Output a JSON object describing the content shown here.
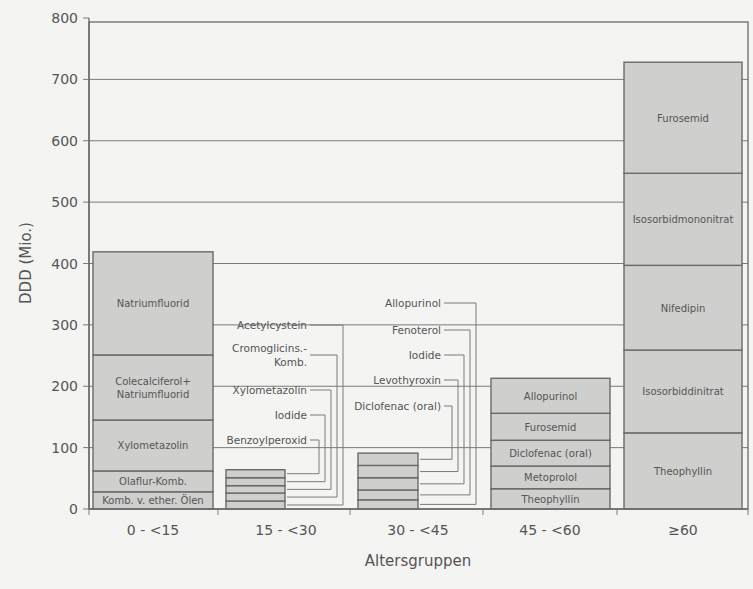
{
  "chart_data": {
    "type": "bar",
    "stacked": true,
    "title": "",
    "xlabel": "Altersgruppen",
    "ylabel": "DDD (Mio.)",
    "ylim": [
      0,
      800
    ],
    "yticks": [
      0,
      100,
      200,
      300,
      400,
      500,
      600,
      700,
      800
    ],
    "grid": true,
    "legend": "none (segments labelled inline / via leader lines)",
    "categories": [
      "0 - <15",
      "15 - <30",
      "30 - <45",
      "45 - <60",
      "≥60"
    ],
    "bars": [
      {
        "category": "0 - <15",
        "total": 419,
        "label_mode": "inline",
        "segments": [
          {
            "name": "Komb. v. ether. Ölen",
            "value": 28
          },
          {
            "name": "Olaflur-Komb.",
            "value": 34
          },
          {
            "name": "Xylometazolin",
            "value": 83
          },
          {
            "name": "Colecalciferol+ Natriumfluorid",
            "value": 106
          },
          {
            "name": "Natriumfluorid",
            "value": 168
          }
        ]
      },
      {
        "category": "15 - <30",
        "total": 64,
        "label_mode": "callout",
        "segments": [
          {
            "name": "Acetylcystein",
            "value": 13
          },
          {
            "name": "Cromoglicins.- Komb.",
            "value": 13
          },
          {
            "name": "Xylometazolin",
            "value": 12
          },
          {
            "name": "Iodide",
            "value": 13
          },
          {
            "name": "Benzoylperoxid",
            "value": 13
          }
        ]
      },
      {
        "category": "30 - <45",
        "total": 91,
        "label_mode": "callout",
        "segments": [
          {
            "name": "Allopurinol",
            "value": 15
          },
          {
            "name": "Fenoterol",
            "value": 16
          },
          {
            "name": "Iodide",
            "value": 20
          },
          {
            "name": "Levothyroxin",
            "value": 20
          },
          {
            "name": "Diclofenac (oral)",
            "value": 20
          }
        ]
      },
      {
        "category": "45 - <60",
        "total": 213,
        "label_mode": "inline",
        "segments": [
          {
            "name": "Theophyllin",
            "value": 33
          },
          {
            "name": "Metoprolol",
            "value": 37
          },
          {
            "name": "Diclofenac (oral)",
            "value": 42
          },
          {
            "name": "Furosemid",
            "value": 44
          },
          {
            "name": "Allopurinol",
            "value": 57
          }
        ]
      },
      {
        "category": "≥60",
        "total": 728,
        "label_mode": "inline",
        "segments": [
          {
            "name": "Theophyllin",
            "value": 124
          },
          {
            "name": "Isosorbiddinitrat",
            "value": 135
          },
          {
            "name": "Nifedipin",
            "value": 138
          },
          {
            "name": "Isosorbidmononitrat",
            "value": 150
          },
          {
            "name": "Furosemid",
            "value": 181
          }
        ]
      }
    ],
    "colors": {
      "background": "#f4f4f2",
      "bar_fill": "#cfcfcd",
      "bar_stroke": "#6a6a6a",
      "grid": "#7a7a7a",
      "text": "#555555"
    }
  }
}
